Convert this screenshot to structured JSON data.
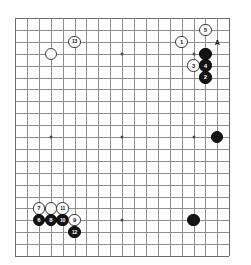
{
  "board": {
    "type": "go-board",
    "columns": 18,
    "rows": 20,
    "cell_size": 11.9,
    "origin_x": 15,
    "origin_y": 18,
    "line_color": "#8e8e8e",
    "edge_color": "#6b6b6b",
    "background_color": "#ffffff",
    "black_color": "#141414",
    "white_color": "#fdfdfd",
    "star_points": [
      {
        "col": 3,
        "row": 3
      },
      {
        "col": 9,
        "row": 3
      },
      {
        "col": 15,
        "row": 3
      },
      {
        "col": 3,
        "row": 10
      },
      {
        "col": 9,
        "row": 10
      },
      {
        "col": 15,
        "row": 10
      },
      {
        "col": 3,
        "row": 17
      },
      {
        "col": 9,
        "row": 17
      },
      {
        "col": 15,
        "row": 17
      }
    ],
    "stones": [
      {
        "id": "white-plain-upper-left",
        "color": "white",
        "label": "",
        "col": 3,
        "row": 3
      },
      {
        "id": "white-13",
        "color": "white",
        "label": "13",
        "col": 5,
        "row": 2
      },
      {
        "id": "white-1",
        "color": "white",
        "label": "1",
        "col": 14,
        "row": 2
      },
      {
        "id": "white-5",
        "color": "white",
        "label": "5",
        "col": 16,
        "row": 1
      },
      {
        "id": "black-stone-upper-right",
        "color": "black",
        "label": "",
        "col": 16,
        "row": 3
      },
      {
        "id": "white-3",
        "color": "white",
        "label": "3",
        "col": 15,
        "row": 4
      },
      {
        "id": "black-4",
        "color": "black",
        "label": "4",
        "col": 16,
        "row": 4
      },
      {
        "id": "black-2",
        "color": "black",
        "label": "2",
        "col": 16,
        "row": 5
      },
      {
        "id": "black-stone-right-side",
        "color": "black",
        "label": "",
        "col": 17,
        "row": 10
      },
      {
        "id": "black-stone-lower-right",
        "color": "black",
        "label": "",
        "col": 15,
        "row": 17
      },
      {
        "id": "white-7",
        "color": "white",
        "label": "7",
        "col": 2,
        "row": 16
      },
      {
        "id": "white-plain-lower-left",
        "color": "white",
        "label": "",
        "col": 3,
        "row": 16
      },
      {
        "id": "white-11",
        "color": "white",
        "label": "11",
        "col": 4,
        "row": 16
      },
      {
        "id": "black-6",
        "color": "black",
        "label": "6",
        "col": 2,
        "row": 17
      },
      {
        "id": "black-8",
        "color": "black",
        "label": "8",
        "col": 3,
        "row": 17
      },
      {
        "id": "black-10",
        "color": "black",
        "label": "10",
        "col": 4,
        "row": 17
      },
      {
        "id": "white-9",
        "color": "white",
        "label": "9",
        "col": 5,
        "row": 17
      },
      {
        "id": "black-12",
        "color": "black",
        "label": "12",
        "col": 5,
        "row": 18
      }
    ],
    "markers": [
      {
        "id": "point-a",
        "label": "A",
        "col": 17,
        "row": 2
      }
    ]
  }
}
